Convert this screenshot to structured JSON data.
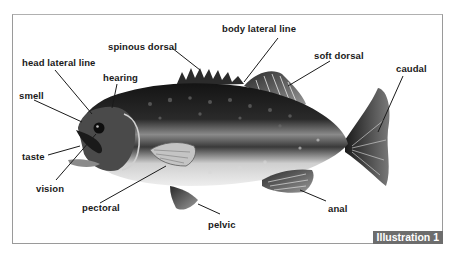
{
  "diagram": {
    "labels": [
      {
        "id": "body-lateral-line",
        "text": "body lateral line",
        "x": 222,
        "y": 24
      },
      {
        "id": "spinous-dorsal",
        "text": "spinous dorsal",
        "x": 108,
        "y": 42
      },
      {
        "id": "soft-dorsal",
        "text": "soft dorsal",
        "x": 314,
        "y": 51
      },
      {
        "id": "caudal",
        "text": "caudal",
        "x": 396,
        "y": 64
      },
      {
        "id": "head-lateral-line",
        "text": "head lateral line",
        "x": 22,
        "y": 58
      },
      {
        "id": "hearing",
        "text": "hearing",
        "x": 103,
        "y": 73
      },
      {
        "id": "smell",
        "text": "smell",
        "x": 19,
        "y": 91
      },
      {
        "id": "taste",
        "text": "taste",
        "x": 22,
        "y": 152
      },
      {
        "id": "vision",
        "text": "vision",
        "x": 36,
        "y": 184
      },
      {
        "id": "pectoral",
        "text": "pectoral",
        "x": 82,
        "y": 203
      },
      {
        "id": "anal",
        "text": "anal",
        "x": 328,
        "y": 204
      },
      {
        "id": "pelvic",
        "text": "pelvic",
        "x": 208,
        "y": 220
      }
    ],
    "badge": "Illustration 1",
    "colors": {
      "frame": "#9a9a9a",
      "badge_bg": "#6d6d6d",
      "badge_text": "#ffffff",
      "label_text": "#1a1a1a",
      "leader_line": "#1a1a1a"
    }
  }
}
